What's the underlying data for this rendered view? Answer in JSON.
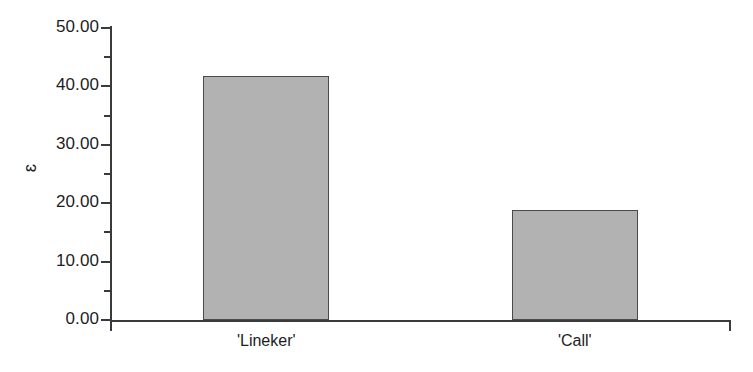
{
  "chart_data": {
    "type": "bar",
    "title": "",
    "xlabel": "",
    "ylabel": "ɛ",
    "categories": [
      "'Lineker'",
      "'Call'"
    ],
    "values": [
      41.7,
      18.8
    ],
    "ylim": [
      0,
      50
    ],
    "ytick_labels": [
      "0.00",
      "10.00",
      "20.00",
      "30.00",
      "40.00",
      "50.00"
    ],
    "ytick_values": [
      0,
      10,
      20,
      30,
      40,
      50
    ],
    "yminor_step": 5,
    "grid": false,
    "legend": false,
    "bar_fill_color": "#b2b2b2",
    "bar_edge_color": "#4a4a4a",
    "axis_color": "#3a3a3a",
    "text_color": "#1d1d1d",
    "background_color": "#ffffff"
  },
  "axis": {
    "y_title": "ɛ",
    "ticks": [
      {
        "label": "50.00",
        "value": 50
      },
      {
        "label": "40.00",
        "value": 40
      },
      {
        "label": "30.00",
        "value": 30
      },
      {
        "label": "20.00",
        "value": 20
      },
      {
        "label": "10.00",
        "value": 10
      },
      {
        "label": "0.00",
        "value": 0
      }
    ]
  },
  "bars": [
    {
      "category": "'Lineker'",
      "value": 41.7
    },
    {
      "category": "'Call'",
      "value": 18.8
    }
  ]
}
